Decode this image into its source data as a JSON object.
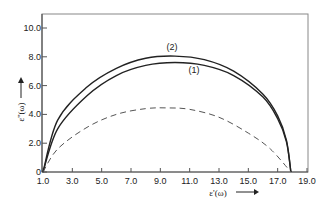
{
  "chart_data": {
    "type": "line",
    "title": "",
    "xlabel": "ε'(ω)",
    "ylabel": "ε''(ω)",
    "xlim": [
      1.0,
      19.0
    ],
    "ylim": [
      0,
      10.0
    ],
    "grid": false,
    "x_ticks": [
      "1.0",
      "3.0",
      "5.0",
      "7.0",
      "9.0",
      "11.0",
      "13.0",
      "15.0",
      "17.0",
      "19.0"
    ],
    "y_ticks": [
      "0",
      "2.0",
      "4.0",
      "6.0",
      "8.0",
      "10.0"
    ],
    "series": [
      {
        "name": "(2)",
        "style": "solid",
        "x": [
          1.0,
          2.0,
          4.0,
          6.0,
          8.0,
          10.0,
          12.0,
          14.0,
          16.0,
          17.0,
          17.6,
          17.9
        ],
        "y": [
          0,
          3.6,
          5.9,
          7.2,
          7.9,
          8.05,
          7.8,
          7.0,
          5.4,
          3.9,
          2.2,
          0
        ]
      },
      {
        "name": "(1)",
        "style": "solid",
        "x": [
          1.0,
          2.0,
          4.0,
          6.0,
          8.0,
          10.0,
          12.0,
          14.0,
          16.0,
          17.0,
          17.6,
          17.9
        ],
        "y": [
          0,
          3.0,
          5.3,
          6.7,
          7.4,
          7.6,
          7.4,
          6.7,
          5.2,
          3.7,
          2.1,
          0
        ]
      },
      {
        "name": "dashed",
        "style": "dashed",
        "x": [
          1.0,
          2.0,
          4.0,
          6.0,
          8.0,
          9.5,
          11.0,
          13.0,
          15.0,
          16.5,
          17.9
        ],
        "y": [
          0,
          1.6,
          3.1,
          4.0,
          4.4,
          4.45,
          4.35,
          3.8,
          2.7,
          1.6,
          0
        ]
      }
    ],
    "annotations": [
      {
        "text": "(2)",
        "x": 9.8,
        "y": 8.5
      },
      {
        "text": "(1)",
        "x": 11.3,
        "y": 6.9
      }
    ]
  }
}
